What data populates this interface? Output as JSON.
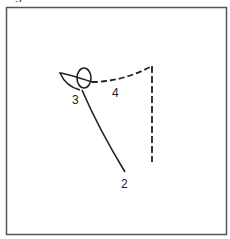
{
  "figure": {
    "caption_fragment": "Fig",
    "frame_color": "#555555",
    "stroke_color": "#222222",
    "labels": [
      {
        "id": "label-2",
        "text": "2",
        "x": 121,
        "y": 188
      },
      {
        "id": "label-3",
        "text": "3",
        "x": 72,
        "y": 104
      },
      {
        "id": "label-4",
        "text": "4",
        "x": 112,
        "y": 97
      }
    ],
    "paths": {
      "solid_path": "from loop at (82,92) to end point (125,172), labeled 2",
      "loop": "small ellipse centered near (84,78) with left curved tail, labeled 3",
      "dashed_arc": "from loop (92,82) curving to corner (152,66), labeled 4",
      "dashed_vertical": "from corner (152,66) down to (152,162)"
    }
  }
}
